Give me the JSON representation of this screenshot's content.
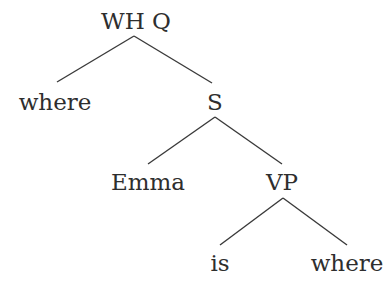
{
  "diagram": {
    "type": "syntax-tree",
    "nodes": [
      {
        "id": "whq",
        "label": "WH Q",
        "x": 136,
        "y": 29
      },
      {
        "id": "where1",
        "label": "where",
        "x": 55,
        "y": 110
      },
      {
        "id": "s",
        "label": "S",
        "x": 215,
        "y": 110
      },
      {
        "id": "emma",
        "label": "Emma",
        "x": 148,
        "y": 190
      },
      {
        "id": "vp",
        "label": "VP",
        "x": 282,
        "y": 190
      },
      {
        "id": "is",
        "label": "is",
        "x": 220,
        "y": 271
      },
      {
        "id": "where2",
        "label": "where",
        "x": 347,
        "y": 271
      }
    ],
    "edges": [
      {
        "from": "whq",
        "to": "where1",
        "x1": 134,
        "y1": 36,
        "x2": 57,
        "y2": 82
      },
      {
        "from": "whq",
        "to": "s",
        "x1": 134,
        "y1": 36,
        "x2": 212,
        "y2": 83
      },
      {
        "from": "s",
        "to": "emma",
        "x1": 215,
        "y1": 117,
        "x2": 148,
        "y2": 164
      },
      {
        "from": "s",
        "to": "vp",
        "x1": 215,
        "y1": 117,
        "x2": 282,
        "y2": 164
      },
      {
        "from": "vp",
        "to": "is",
        "x1": 283,
        "y1": 198,
        "x2": 220,
        "y2": 245
      },
      {
        "from": "vp",
        "to": "where2",
        "x1": 283,
        "y1": 198,
        "x2": 347,
        "y2": 245
      }
    ]
  },
  "labels": {
    "root": "WH Q",
    "where_fronted": "where",
    "s": "S",
    "emma": "Emma",
    "vp": "VP",
    "is": "is",
    "where_trace": "where"
  }
}
